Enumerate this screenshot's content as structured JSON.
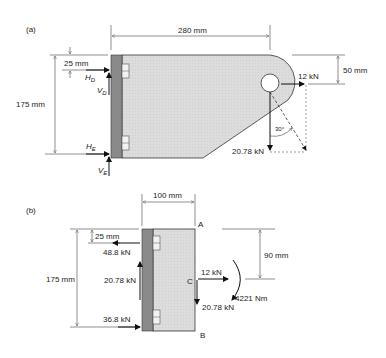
{
  "figure_a": {
    "label": "(a)",
    "dim_width": "280 mm",
    "dim_top_offset": "25 mm",
    "dim_height": "175 mm",
    "dim_pin_offset": "50 mm",
    "reaction_HD": "H",
    "reaction_HD_sub": "D",
    "reaction_VD": "V",
    "reaction_VD_sub": "D",
    "reaction_HE": "H",
    "reaction_HE_sub": "E",
    "reaction_VE": "V",
    "reaction_VE_sub": "E",
    "load_horizontal": "12 kN",
    "load_vertical": "20.78 kN",
    "angle": "30°"
  },
  "figure_b": {
    "label": "(b)",
    "dim_width": "100 mm",
    "dim_top_offset": "25 mm",
    "dim_height": "175 mm",
    "dim_C_offset": "90 mm",
    "force_top": "48.8 kN",
    "force_shear": "20.78 kN",
    "force_bottom": "36.8 kN",
    "point_A": "A",
    "point_B": "B",
    "point_C": "C",
    "load_horizontal": "12 kN",
    "load_vertical": "20.78 kN",
    "moment": "4221 Nm"
  }
}
